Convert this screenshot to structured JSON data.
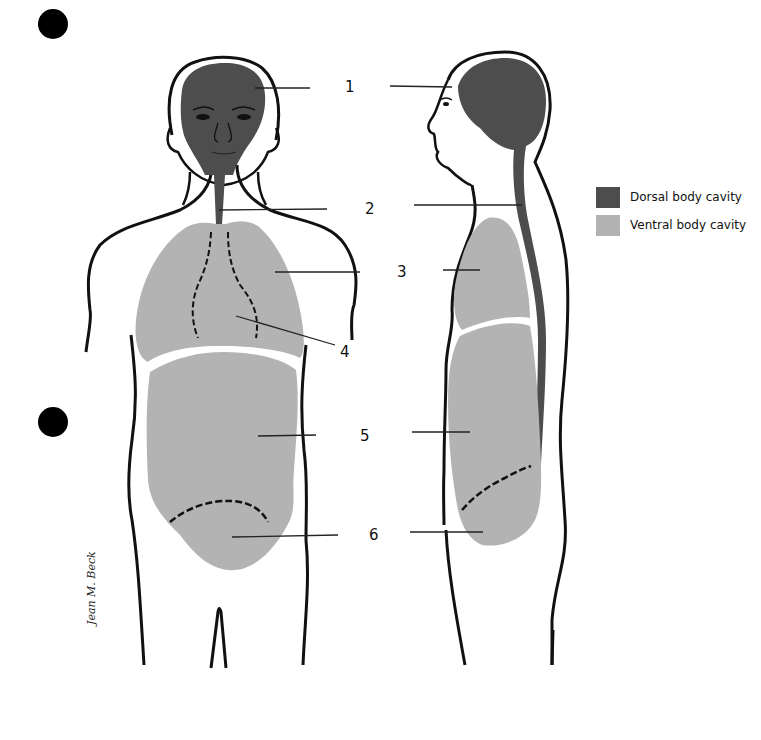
{
  "figure": {
    "labels": [
      {
        "id": 1,
        "text": "1"
      },
      {
        "id": 2,
        "text": "2"
      },
      {
        "id": 3,
        "text": "3"
      },
      {
        "id": 4,
        "text": "4"
      },
      {
        "id": 5,
        "text": "5"
      },
      {
        "id": 6,
        "text": "6"
      }
    ],
    "legend": [
      {
        "label": "Dorsal body cavity",
        "color": "#4d4d4d"
      },
      {
        "label": "Ventral body cavity",
        "color": "#b3b3b3"
      }
    ],
    "signature": "Jean M. Beck"
  },
  "colors": {
    "dorsal": "#4d4d4d",
    "ventral": "#b3b3b3",
    "outline": "#111111",
    "background": "#ffffff"
  }
}
